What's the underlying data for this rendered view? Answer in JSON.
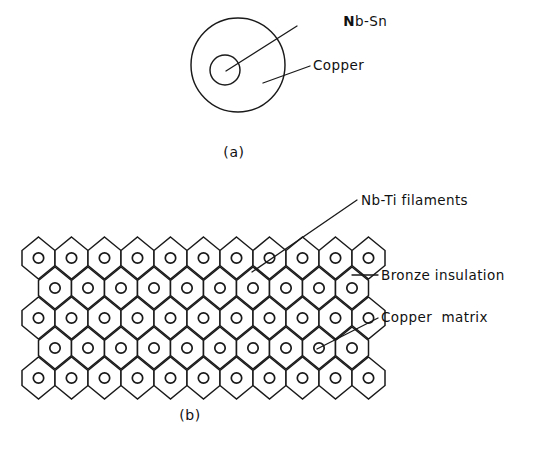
{
  "figure": {
    "panels": [
      {
        "id": "a",
        "caption": "(a)",
        "labels": [
          {
            "name": "nb-sn",
            "text": "Nb-Sn",
            "bold_prefix": "N",
            "rest": "b-Sn"
          },
          {
            "name": "copper",
            "text": "Copper"
          }
        ],
        "geometry": {
          "outer_circle": {
            "cx": 238,
            "cy": 65,
            "r": 47
          },
          "inner_circle": {
            "cx": 225,
            "cy": 70,
            "r": 15
          }
        }
      },
      {
        "id": "b",
        "caption": "(b)",
        "labels": [
          {
            "name": "nb-ti-filaments",
            "text": "Nb-Ti filaments"
          },
          {
            "name": "bronze-insulation",
            "text": "Bronze insulation"
          },
          {
            "name": "copper-matrix",
            "text": "Copper  matrix"
          }
        ],
        "grid": {
          "rows": 5,
          "odd_row_count": 11,
          "even_row_count": 10,
          "hex_width": 33,
          "hex_height": 30,
          "origin_x": 22,
          "origin_y": 258,
          "dot_radius": 5.2
        }
      }
    ],
    "colors": {
      "ink": "#1a1a1a",
      "background": "#ffffff",
      "fill": "#ffffff"
    }
  }
}
